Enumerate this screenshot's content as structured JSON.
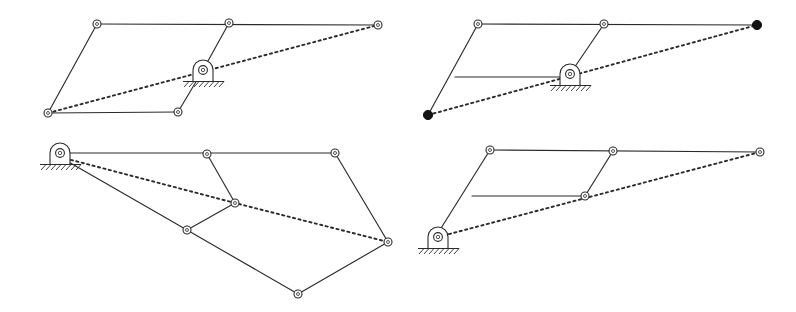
{
  "figure": {
    "panel_count": 4,
    "background_color": "#ffffff",
    "line_color": "#2b2b2b",
    "filled_node_color": "#131313",
    "canvas": {
      "width": 796,
      "height": 312
    }
  },
  "legend": {
    "open_joint_label": "pin joint (open circle)",
    "filled_joint_label": "traced point (filled circle)",
    "solid_link_label": "rigid link",
    "dashed_line_label": "coupler trace / reference line",
    "ground_pivot_label": "fixed ground pivot with hatching"
  },
  "panels": [
    {
      "id": "panel-top-left",
      "name": "top-left-mechanism",
      "position": "top left",
      "joints": [
        {
          "name": "upper-left-joint",
          "x": 97,
          "y": 24,
          "type": "open"
        },
        {
          "name": "upper-mid-joint",
          "x": 229,
          "y": 23,
          "type": "open"
        },
        {
          "name": "upper-right-joint",
          "x": 378,
          "y": 25,
          "type": "open"
        },
        {
          "name": "lower-left-joint",
          "x": 48,
          "y": 113,
          "type": "open"
        },
        {
          "name": "lower-mid-joint",
          "x": 178,
          "y": 112,
          "type": "open"
        }
      ],
      "ground_pivot": {
        "name": "ground-pivot",
        "x": 203,
        "y": 70
      },
      "links": [
        {
          "name": "link-top-bar",
          "from": [
            97,
            24
          ],
          "to": [
            378,
            25
          ]
        },
        {
          "name": "link-left-side",
          "from": [
            97,
            24
          ],
          "to": [
            48,
            113
          ]
        },
        {
          "name": "link-bottom-bar",
          "from": [
            48,
            113
          ],
          "to": [
            178,
            112
          ]
        },
        {
          "name": "link-crank-upper",
          "from": [
            229,
            23
          ],
          "to": [
            203,
            70
          ]
        },
        {
          "name": "link-crank-lower",
          "from": [
            203,
            70
          ],
          "to": [
            178,
            112
          ]
        }
      ],
      "trace": {
        "name": "coupler-trace",
        "from": [
          48,
          113
        ],
        "to": [
          378,
          25
        ]
      }
    },
    {
      "id": "panel-top-right",
      "name": "top-right-mechanism",
      "position": "top right",
      "joints": [
        {
          "name": "upper-left-joint",
          "x": 478,
          "y": 24,
          "type": "open"
        },
        {
          "name": "upper-mid-joint",
          "x": 604,
          "y": 24,
          "type": "open"
        },
        {
          "name": "traced-point-right",
          "x": 757,
          "y": 25,
          "type": "filled"
        },
        {
          "name": "traced-point-left",
          "x": 428,
          "y": 115,
          "type": "filled"
        },
        {
          "name": "mid-bar-left-joint",
          "x": 455,
          "y": 77,
          "type": "none"
        }
      ],
      "ground_pivot": {
        "name": "ground-pivot",
        "x": 570,
        "y": 74
      },
      "links": [
        {
          "name": "link-top-bar",
          "from": [
            478,
            24
          ],
          "to": [
            757,
            25
          ]
        },
        {
          "name": "link-left-side",
          "from": [
            478,
            24
          ],
          "to": [
            428,
            115
          ]
        },
        {
          "name": "link-mid-bar",
          "from": [
            455,
            77
          ],
          "to": [
            570,
            77
          ]
        },
        {
          "name": "link-crank",
          "from": [
            604,
            24
          ],
          "to": [
            570,
            74
          ]
        }
      ],
      "trace": {
        "name": "coupler-trace",
        "from": [
          428,
          115
        ],
        "to": [
          757,
          25
        ]
      }
    },
    {
      "id": "panel-bottom-left",
      "name": "bottom-left-mechanism",
      "position": "bottom left",
      "joints": [
        {
          "name": "upper-mid-joint",
          "x": 207,
          "y": 154,
          "type": "open"
        },
        {
          "name": "upper-right-joint",
          "x": 335,
          "y": 153,
          "type": "open"
        },
        {
          "name": "center-joint",
          "x": 235,
          "y": 203,
          "type": "open"
        },
        {
          "name": "left-lower-joint",
          "x": 187,
          "y": 230,
          "type": "open"
        },
        {
          "name": "right-lower-joint",
          "x": 388,
          "y": 242,
          "type": "open"
        },
        {
          "name": "bottom-joint",
          "x": 298,
          "y": 294,
          "type": "open"
        }
      ],
      "ground_pivot": {
        "name": "ground-pivot",
        "x": 60,
        "y": 153
      },
      "links": [
        {
          "name": "link-top-bar",
          "from": [
            60,
            153
          ],
          "to": [
            335,
            153
          ]
        },
        {
          "name": "link-right-side",
          "from": [
            335,
            153
          ],
          "to": [
            388,
            242
          ]
        },
        {
          "name": "link-upper-connector",
          "from": [
            207,
            154
          ],
          "to": [
            235,
            203
          ]
        },
        {
          "name": "link-center-to-left",
          "from": [
            235,
            203
          ],
          "to": [
            187,
            230
          ]
        },
        {
          "name": "link-ground-to-left",
          "from": [
            60,
            157
          ],
          "to": [
            187,
            230
          ]
        },
        {
          "name": "link-left-to-bottom",
          "from": [
            187,
            230
          ],
          "to": [
            298,
            294
          ]
        },
        {
          "name": "link-bottom-to-right",
          "from": [
            298,
            294
          ],
          "to": [
            388,
            242
          ]
        }
      ],
      "trace": {
        "name": "coupler-trace-polyline",
        "points": [
          [
            60,
            157
          ],
          [
            235,
            203
          ],
          [
            388,
            242
          ]
        ]
      }
    },
    {
      "id": "panel-bottom-right",
      "name": "bottom-right-mechanism",
      "position": "bottom right",
      "joints": [
        {
          "name": "upper-left-joint",
          "x": 490,
          "y": 150,
          "type": "open"
        },
        {
          "name": "upper-mid-joint",
          "x": 613,
          "y": 151,
          "type": "open"
        },
        {
          "name": "upper-right-joint",
          "x": 760,
          "y": 152,
          "type": "open"
        },
        {
          "name": "mid-right-joint",
          "x": 585,
          "y": 196,
          "type": "open"
        },
        {
          "name": "mid-left-joint",
          "x": 472,
          "y": 196,
          "type": "none"
        }
      ],
      "ground_pivot": {
        "name": "ground-pivot",
        "x": 438,
        "y": 237
      },
      "links": [
        {
          "name": "link-top-bar",
          "from": [
            490,
            150
          ],
          "to": [
            760,
            152
          ]
        },
        {
          "name": "link-left-side",
          "from": [
            490,
            150
          ],
          "to": [
            438,
            233
          ]
        },
        {
          "name": "link-mid-bar",
          "from": [
            472,
            196
          ],
          "to": [
            585,
            196
          ]
        },
        {
          "name": "link-crank",
          "from": [
            613,
            151
          ],
          "to": [
            585,
            196
          ]
        }
      ],
      "trace": {
        "name": "coupler-trace",
        "from": [
          438,
          237
        ],
        "to": [
          760,
          152
        ]
      }
    }
  ]
}
